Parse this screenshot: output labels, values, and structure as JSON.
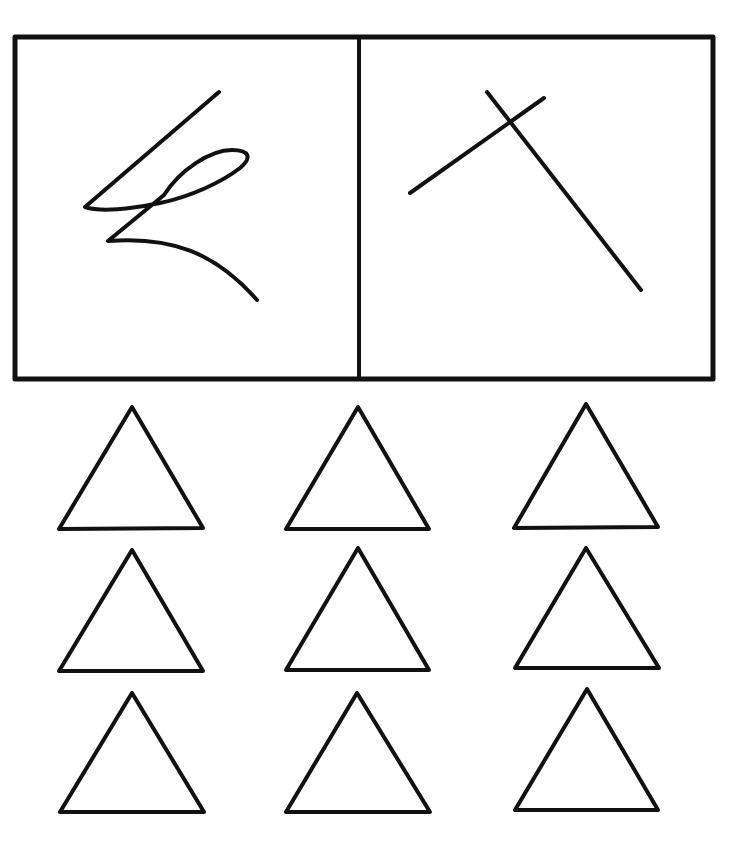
{
  "figure": {
    "background": "#ffffff",
    "stroke_color": "#111111",
    "panels": [
      {
        "name": "left-panel",
        "content": "scribble-figure"
      },
      {
        "name": "right-panel",
        "content": "crossed-lines-figure"
      }
    ],
    "triangle_grid": {
      "rows": 3,
      "cols": 3,
      "shape": "triangle-outline"
    }
  }
}
